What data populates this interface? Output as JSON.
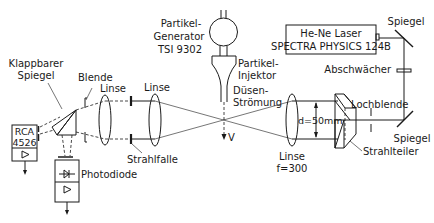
{
  "diagram": {
    "labels": {
      "particle_generator_line1": "Partikel-",
      "particle_generator_line2": "Generator",
      "particle_generator_line3": "TSI 9302",
      "particle_injector_line1": "Partikel-",
      "particle_injector_line2": "Injektor",
      "nozzle_flow_line1": "Düsen-",
      "nozzle_flow_line2": "Strömung",
      "velocity": "V",
      "laser_line1": "He-Ne Laser",
      "laser_line2": "SPECTRA PHYSICS  124B",
      "mirror_top": "Spiegel",
      "attenuator": "Abschwächer",
      "pinhole": "Lochblende",
      "mirror_bottom": "Spiegel",
      "beam_splitter": "Strahlteiler",
      "beam_distance": "d=50mm",
      "lens_focal_line1": "Linse",
      "lens_focal_line2": "f=300",
      "lens_middle": "Linse",
      "beam_trap": "Strahlfalle",
      "lens_left": "Linse",
      "aperture": "Blende",
      "flip_mirror_line1": "Klappbarer",
      "flip_mirror_line2": "Spiegel",
      "pmt_line1": "RCA",
      "pmt_line2": "4526",
      "photodiode": "Photodiode"
    },
    "icons": {
      "amplifier": "triangle-amplifier-icon",
      "diode": "diode-symbol-icon",
      "output_arrow": "arrow-down-icon"
    }
  }
}
